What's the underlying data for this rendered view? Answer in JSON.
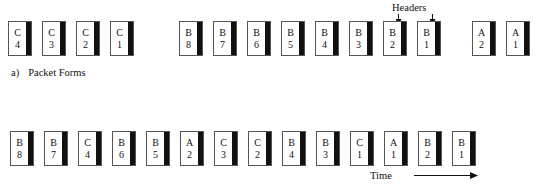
{
  "figure": {
    "caption": {
      "tag": "a)",
      "text": "Packet Forms"
    },
    "headers_label": "Headers",
    "time_label": "Time"
  },
  "packet_forms_row": {
    "groups": [
      {
        "name": "group-c",
        "start_x": 8,
        "packets": [
          {
            "letter": "C",
            "number": "4"
          },
          {
            "letter": "C",
            "number": "3"
          },
          {
            "letter": "C",
            "number": "2"
          },
          {
            "letter": "C",
            "number": "1"
          }
        ]
      },
      {
        "name": "group-b",
        "start_x": 179,
        "packets": [
          {
            "letter": "B",
            "number": "8"
          },
          {
            "letter": "B",
            "number": "7"
          },
          {
            "letter": "B",
            "number": "6"
          },
          {
            "letter": "B",
            "number": "5"
          },
          {
            "letter": "B",
            "number": "4"
          },
          {
            "letter": "B",
            "number": "3"
          },
          {
            "letter": "B",
            "number": "2"
          },
          {
            "letter": "B",
            "number": "1"
          }
        ]
      },
      {
        "name": "group-a",
        "start_x": 472,
        "packets": [
          {
            "letter": "A",
            "number": "2"
          },
          {
            "letter": "A",
            "number": "1"
          }
        ]
      }
    ]
  },
  "transmission_row": {
    "start_x": 10,
    "spacing": 34,
    "packets": [
      {
        "letter": "B",
        "number": "8"
      },
      {
        "letter": "B",
        "number": "7"
      },
      {
        "letter": "C",
        "number": "4"
      },
      {
        "letter": "B",
        "number": "6"
      },
      {
        "letter": "B",
        "number": "5"
      },
      {
        "letter": "A",
        "number": "2"
      },
      {
        "letter": "C",
        "number": "3"
      },
      {
        "letter": "C",
        "number": "2"
      },
      {
        "letter": "B",
        "number": "4"
      },
      {
        "letter": "B",
        "number": "3"
      },
      {
        "letter": "C",
        "number": "1"
      },
      {
        "letter": "A",
        "number": "1"
      },
      {
        "letter": "B",
        "number": "2"
      },
      {
        "letter": "B",
        "number": "1"
      }
    ]
  },
  "colors": {
    "header_stripe": "#111111",
    "packet_border": "#555555",
    "packet_fill": "#ffffff",
    "text": "#111111",
    "background": "#ffffff"
  }
}
